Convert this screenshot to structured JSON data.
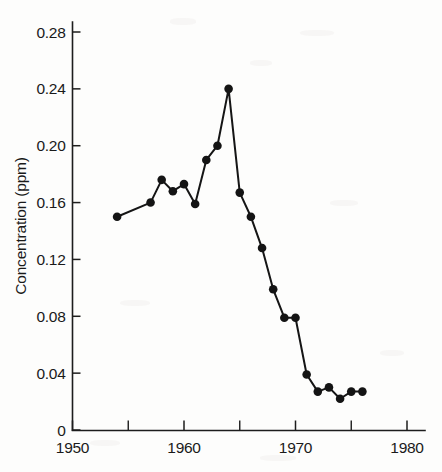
{
  "chart_data": {
    "type": "line",
    "title": "",
    "xlabel": "",
    "ylabel": "Concentration (ppm)",
    "xlim": [
      1950,
      1981
    ],
    "ylim": [
      0,
      0.295
    ],
    "grid": false,
    "legend": "none",
    "marker": "filled-circle",
    "x": [
      1954,
      1957,
      1958,
      1959,
      1960,
      1961,
      1962,
      1963,
      1964,
      1965,
      1966,
      1967,
      1968,
      1969,
      1970,
      1971,
      1972,
      1973,
      1974,
      1975,
      1976
    ],
    "values": [
      0.15,
      0.16,
      0.176,
      0.168,
      0.173,
      0.159,
      0.19,
      0.2,
      0.24,
      0.167,
      0.15,
      0.128,
      0.099,
      0.079,
      0.079,
      0.039,
      0.027,
      0.03,
      0.022,
      0.027,
      0.027
    ],
    "series": [
      {
        "name": "Concentration",
        "values": [
          0.15,
          0.16,
          0.176,
          0.168,
          0.173,
          0.159,
          0.19,
          0.2,
          0.24,
          0.167,
          0.15,
          0.128,
          0.099,
          0.079,
          0.079,
          0.039,
          0.027,
          0.03,
          0.022,
          0.027,
          0.027
        ]
      }
    ],
    "yticks": [
      0,
      0.04,
      0.08,
      0.12,
      0.16,
      0.2,
      0.24,
      0.28
    ],
    "ytick_labels": [
      "0",
      "0.04",
      "0.08",
      "0.12",
      "0.16",
      "0.20",
      "0.24",
      "0.28"
    ],
    "xticks": [
      1950,
      1960,
      1970,
      1980
    ],
    "xtick_labels": [
      "1950",
      "1960",
      "1970",
      "1980"
    ],
    "xticks_minor": [
      1955,
      1965,
      1975
    ],
    "colors": {
      "line": "#151515",
      "marker": "#141414",
      "axis": "#1d1d1d",
      "text": "#1a1a1a",
      "background": "#fdfdfc"
    }
  },
  "axes": {
    "y_title": "Concentration (ppm)",
    "x_title": ""
  }
}
